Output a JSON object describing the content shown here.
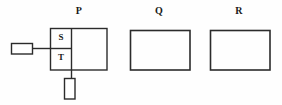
{
  "diagram": {
    "title": "",
    "background_color": "#fefefe",
    "line_color": "#2b2b2b",
    "text_color": "#1a1a1a",
    "groups": [
      {
        "id": "P",
        "label": "P",
        "x": 50,
        "y": 28,
        "width": 57,
        "height": 42
      },
      {
        "id": "Q",
        "label": "Q",
        "x": 130,
        "y": 30,
        "width": 60,
        "height": 40
      },
      {
        "id": "R",
        "label": "R",
        "x": 210,
        "y": 30,
        "width": 60,
        "height": 40
      }
    ],
    "cells": [
      {
        "id": "S",
        "label": "S",
        "x": 50,
        "y": 28,
        "width": 22,
        "height": 20
      },
      {
        "id": "T",
        "label": "T",
        "x": 50,
        "y": 48,
        "width": 22,
        "height": 22
      }
    ],
    "connectors": [
      {
        "id": "left-terminal",
        "shape": "rectangle",
        "orientation": "horizontal",
        "x": 11,
        "y": 43,
        "width": 22,
        "height": 11
      },
      {
        "id": "bottom-terminal",
        "shape": "rectangle",
        "orientation": "vertical",
        "x": 64,
        "y": 78,
        "width": 11,
        "height": 21
      }
    ],
    "lines": [
      {
        "id": "left-lead",
        "x1": 33,
        "y1": 48,
        "x2": 50,
        "y2": 48
      },
      {
        "id": "bottom-lead",
        "x1": 71,
        "y1": 70,
        "x2": 71,
        "y2": 78
      },
      {
        "id": "st-divider",
        "x1": 50,
        "y1": 48,
        "x2": 72,
        "y2": 48
      },
      {
        "id": "st-right-edge",
        "x1": 71,
        "y1": 28,
        "x2": 71,
        "y2": 70
      }
    ]
  }
}
